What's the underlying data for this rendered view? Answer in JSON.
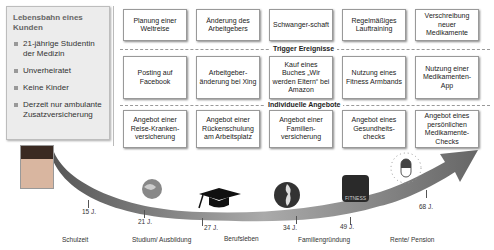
{
  "profile": {
    "title": "Lebensbahn eines Kunden",
    "items": [
      "21-jährige Studentin der Medizin",
      "Unverheiratet",
      "Keine Kinder",
      "Derzeit nur ambulante Zusatzversicherung"
    ]
  },
  "life_events": [
    "Planung einer Weltreise",
    "Änderung des Arbeitgebers",
    "Schwanger-schaft",
    "Regelmäßiges Lauftraining",
    "Verschreibung neuer Medikamente"
  ],
  "sections": {
    "trigger": "Trigger Ereignisse",
    "offers": "Individuelle Angebote"
  },
  "triggers": [
    "Posting auf Facebook",
    "Arbeitgeber-änderung bei Xing",
    "Kauf eines Buches „Wir werden Eltern“ bei Amazon",
    "Nutzung eines Fitness Armbands",
    "Nutzung einer Medikamenten-App"
  ],
  "offers": [
    "Angebot einer Reise-Kranken-versicherung",
    "Angebot einer Rückenschulung am Arbeitsplatz",
    "Angebot einer Familien-versicherung",
    "Angebot eines Gesundheits-checks",
    "Angebot eines persönlichen Medikamente-Checks"
  ],
  "timeline": {
    "ages": [
      "15 J.",
      "21 J.",
      "27 J.",
      "34 J.",
      "49 J.",
      "68 J."
    ],
    "phases": [
      "Schulzeit",
      "Studium/ Ausbildung",
      "Berufsleben",
      "Familiengründung",
      "Rente/ Pension"
    ],
    "icons": [
      "portrait-photo",
      "globe-icon",
      "graduation-cap-icon",
      "pregnancy-icon",
      "fitness-app-icon",
      "pill-clock-icon"
    ],
    "fitness_label": "FITNESS"
  }
}
